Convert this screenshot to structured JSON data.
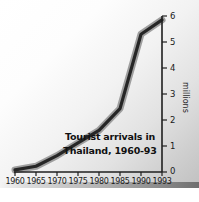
{
  "chart_data": {
    "type": "line",
    "title": "Tourist arrivals in Thailand, 1960-93",
    "title_line1": "Tourist arrivals in",
    "title_line2": "Thailand, 1960-93",
    "xlabel": "",
    "ylabel": "millions",
    "x": [
      1960,
      1965,
      1970,
      1975,
      1980,
      1985,
      1990,
      1993
    ],
    "values": [
      0.08,
      0.22,
      0.63,
      1.12,
      1.6,
      2.44,
      5.3,
      5.85
    ],
    "xticklabels": [
      "1960",
      "1965",
      "1970",
      "1975",
      "1980",
      "1985",
      "1990",
      "1993"
    ],
    "yticklabels": [
      "0",
      "1",
      "2",
      "3",
      "4",
      "5",
      "6"
    ],
    "yticks": [
      0,
      1,
      2,
      3,
      4,
      5,
      6
    ],
    "ylim": [
      0,
      6
    ],
    "xlim": [
      1960,
      1993
    ],
    "grid": false,
    "legend": false,
    "y_axis_position": "right",
    "series_name": "Tourist arrivals",
    "line_color": "#262626",
    "shadow_color": "#9a9a9a",
    "axis_color": "#1f1f1f",
    "background": "#ededed"
  }
}
